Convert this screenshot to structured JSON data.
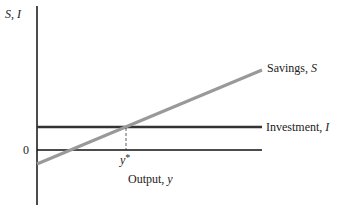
{
  "diagram": {
    "y_axis_label": {
      "a": "S",
      "sep": ", ",
      "b": "I"
    },
    "x_axis_label": {
      "a": "Output, ",
      "b": "y"
    },
    "origin_label": "0",
    "equilibrium_label": {
      "a": "y",
      "b": "*"
    },
    "savings_label": {
      "a": "Savings, ",
      "b": "S"
    },
    "investment_label": {
      "a": "Investment, ",
      "b": "I"
    },
    "colors": {
      "axis": "#111111",
      "investment": "#333333",
      "savings": "#999999",
      "dashed": "#333333"
    }
  }
}
